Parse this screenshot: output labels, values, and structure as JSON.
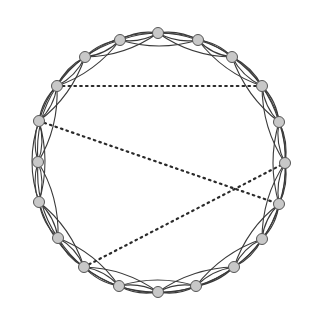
{
  "diagram": {
    "type": "ring-lattice-network",
    "node_count": 20,
    "neighbors_per_side": 2,
    "center": [
      160,
      162
    ],
    "colors": {
      "node_fill": "#c8c8c8",
      "node_stroke": "#555555",
      "edge": "#3a3a3a",
      "shortcut": "#2a2a2a",
      "background": "#ffffff"
    },
    "nodes": [
      [
        158,
        33
      ],
      [
        120,
        40
      ],
      [
        85,
        57
      ],
      [
        57,
        86
      ],
      [
        39,
        121
      ],
      [
        38,
        162
      ],
      [
        39,
        202
      ],
      [
        58,
        238
      ],
      [
        84,
        267
      ],
      [
        119,
        286
      ],
      [
        158,
        292
      ],
      [
        196,
        286
      ],
      [
        234,
        267
      ],
      [
        262,
        239
      ],
      [
        279,
        204
      ],
      [
        285,
        163
      ],
      [
        279,
        122
      ],
      [
        262,
        86
      ],
      [
        232,
        57
      ],
      [
        198,
        40
      ]
    ],
    "shortcuts": [
      [
        3,
        17
      ],
      [
        4,
        14
      ],
      [
        8,
        15
      ]
    ]
  }
}
